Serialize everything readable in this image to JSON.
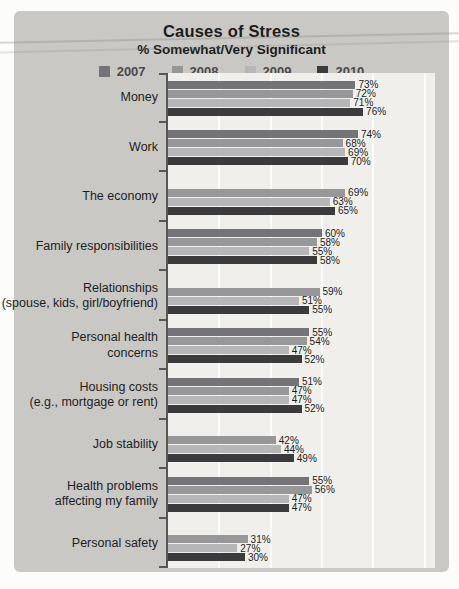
{
  "title": "Causes of Stress",
  "subtitle": "% Somewhat/Very Significant",
  "legend": [
    {
      "label": "2007",
      "color": "#747478"
    },
    {
      "label": "2008",
      "color": "#97979a"
    },
    {
      "label": "2009",
      "color": "#b6b6b8"
    },
    {
      "label": "2010",
      "color": "#3b3b3e"
    }
  ],
  "chart_data": {
    "type": "bar",
    "orientation": "horizontal",
    "title": "Causes of Stress",
    "subtitle": "% Somewhat/Very Significant",
    "unit": "%",
    "xlim": [
      0,
      100
    ],
    "axis_max_pct": 104,
    "gridline_pcts": [
      20,
      40,
      60,
      80,
      100
    ],
    "grid": "vertical-light",
    "legend_position": "top",
    "series_order": [
      "2007",
      "2008",
      "2009",
      "2010"
    ],
    "categories": [
      "Money",
      "Work",
      "The economy",
      "Family responsibilities",
      "Relationships (spouse, kids, girl/boyfriend)",
      "Personal health concerns",
      "Housing costs (e.g., mortgage or rent)",
      "Job stability",
      "Health problems affecting my family",
      "Personal safety"
    ],
    "groups": [
      {
        "label_lines": [
          "Money"
        ],
        "values": {
          "2007": 73,
          "2008": 72,
          "2009": 71,
          "2010": 76
        }
      },
      {
        "label_lines": [
          "Work"
        ],
        "values": {
          "2007": 74,
          "2008": 68,
          "2009": 69,
          "2010": 70
        }
      },
      {
        "label_lines": [
          "The economy"
        ],
        "values": {
          "2007": null,
          "2008": 69,
          "2009": 63,
          "2010": 65
        }
      },
      {
        "label_lines": [
          "Family responsibilities"
        ],
        "values": {
          "2007": 60,
          "2008": 58,
          "2009": 55,
          "2010": 58
        }
      },
      {
        "label_lines": [
          "Relationships",
          "(spouse, kids, girl/boyfriend)"
        ],
        "values": {
          "2007": null,
          "2008": 59,
          "2009": 51,
          "2010": 55
        }
      },
      {
        "label_lines": [
          "Personal health",
          "concerns"
        ],
        "values": {
          "2007": 55,
          "2008": 54,
          "2009": 47,
          "2010": 52
        }
      },
      {
        "label_lines": [
          "Housing costs",
          "(e.g., mortgage or rent)"
        ],
        "values": {
          "2007": 51,
          "2008": 47,
          "2009": 47,
          "2010": 52
        }
      },
      {
        "label_lines": [
          "Job stability"
        ],
        "values": {
          "2007": null,
          "2008": 42,
          "2009": 44,
          "2010": 49
        }
      },
      {
        "label_lines": [
          "Health problems",
          "affecting my family"
        ],
        "values": {
          "2007": 55,
          "2008": 56,
          "2009": 47,
          "2010": 47
        }
      },
      {
        "label_lines": [
          "Personal safety"
        ],
        "values": {
          "2007": null,
          "2008": 31,
          "2009": 27,
          "2010": 30
        }
      }
    ]
  },
  "colors": {
    "page_bg": "#fcfcfa",
    "card_bg": "#c9c8c5",
    "plot_bg": "#f0efeb",
    "axis": "#55555a",
    "text_dark": "#1c1c1c",
    "legend_text": "#4a4a4a",
    "gridline": "#ffffff",
    "series": {
      "2007": "#747478",
      "2008": "#97979a",
      "2009": "#b6b6b8",
      "2010": "#3b3b3e"
    }
  }
}
